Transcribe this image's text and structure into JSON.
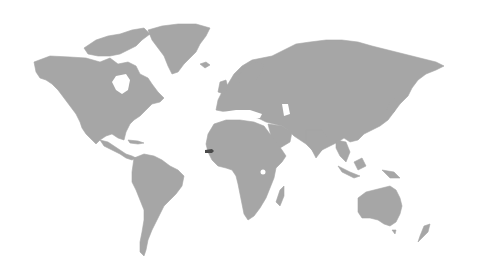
{
  "map": {
    "type": "world-locator",
    "background_color": "#ffffff",
    "land_color": "#a6a6a6",
    "highlight_color": "#4a4a4a",
    "highlighted_country": "Gambia",
    "highlighted_region": "West Africa"
  }
}
